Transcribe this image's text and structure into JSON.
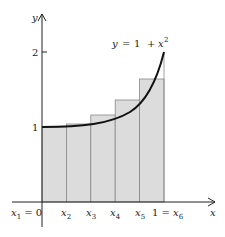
{
  "axes": {
    "x_label": "x",
    "y_label": "y",
    "y_ticks": [
      "1",
      "2"
    ]
  },
  "curve_label": {
    "y": "y",
    "eq": "=",
    "one": "1",
    "plus": "+",
    "x": "x",
    "exp": "2"
  },
  "x_points": [
    {
      "id": "x1",
      "label": "x",
      "sub": "1",
      "suffix": " = 0"
    },
    {
      "id": "x2",
      "label": "x",
      "sub": "2"
    },
    {
      "id": "x3",
      "label": "x",
      "sub": "3"
    },
    {
      "id": "x4",
      "label": "x",
      "sub": "4"
    },
    {
      "id": "x5",
      "label": "x",
      "sub": "5"
    },
    {
      "id": "x6",
      "prefix": "1 = ",
      "label": "x",
      "sub": "6"
    }
  ],
  "colors": {
    "fill": "#dcdcdc",
    "stroke": "#888888",
    "curve": "#111111"
  }
}
